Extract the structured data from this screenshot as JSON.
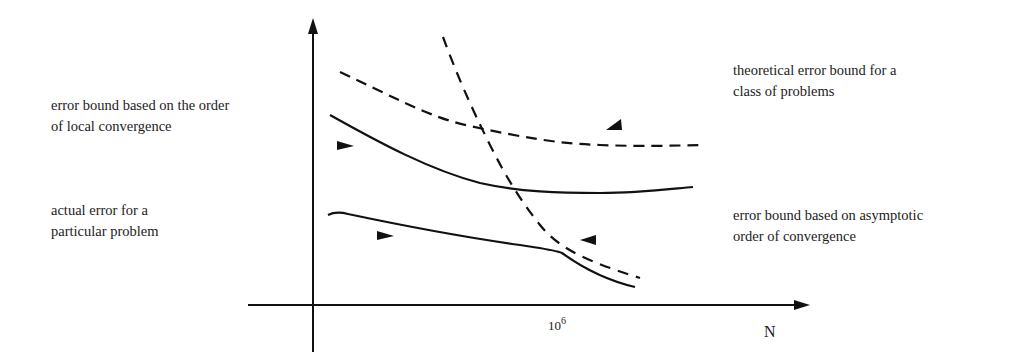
{
  "diagram": {
    "type": "error-bound-vs-N schematic",
    "x_axis": {
      "label": "N",
      "tick_label_base": "10",
      "tick_label_exp": "6"
    },
    "y_axis": {
      "label": ""
    },
    "annotations": {
      "local_order": "error bound based on the order\nof local convergence",
      "actual_error": "actual error for a\nparticular problem",
      "theoretical": "theoretical error bound for a\nclass of problems",
      "asymptotic": "error bound based on asymptotic\norder of convergence"
    },
    "curves": [
      {
        "name": "theoretical error bound",
        "style": "dashed",
        "points": [
          [
            340,
            72
          ],
          [
            400,
            100
          ],
          [
            470,
            125
          ],
          [
            560,
            143
          ],
          [
            640,
            146
          ],
          [
            705,
            145
          ]
        ]
      },
      {
        "name": "local order error bound",
        "style": "solid",
        "points": [
          [
            330,
            115
          ],
          [
            380,
            143
          ],
          [
            430,
            168
          ],
          [
            480,
            183
          ],
          [
            520,
            189
          ],
          [
            600,
            193
          ],
          [
            693,
            187
          ]
        ]
      },
      {
        "name": "asymptotic order error bound",
        "style": "dashed",
        "points": [
          [
            443,
            37
          ],
          [
            458,
            75
          ],
          [
            475,
            110
          ],
          [
            495,
            150
          ],
          [
            512,
            185
          ],
          [
            535,
            220
          ],
          [
            560,
            248
          ],
          [
            600,
            265
          ],
          [
            640,
            278
          ]
        ]
      },
      {
        "name": "actual error",
        "style": "solid",
        "points": [
          [
            328,
            215
          ],
          [
            342,
            213
          ],
          [
            400,
            224
          ],
          [
            460,
            237
          ],
          [
            520,
            245
          ],
          [
            560,
            252
          ],
          [
            585,
            266
          ],
          [
            610,
            279
          ],
          [
            635,
            287
          ]
        ]
      }
    ],
    "colors": {
      "stroke": "#111111",
      "background": "#ffffff"
    }
  }
}
